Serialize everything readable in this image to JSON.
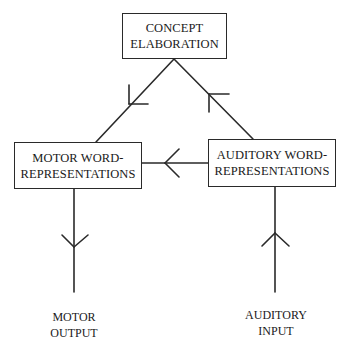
{
  "diagram": {
    "type": "flow",
    "nodes": {
      "concept": {
        "lines": [
          "CONCEPT",
          "ELABORATION"
        ]
      },
      "motor_word": {
        "lines": [
          "MOTOR WORD-",
          "REPRESENTATIONS"
        ]
      },
      "auditory_word": {
        "lines": [
          "AUDITORY WORD-",
          "REPRESENTATIONS"
        ]
      }
    },
    "terminals": {
      "motor_output": {
        "lines": [
          "MOTOR",
          "OUTPUT"
        ]
      },
      "auditory_input": {
        "lines": [
          "AUDITORY",
          "INPUT"
        ]
      }
    },
    "edges": [
      {
        "from": "auditory_input",
        "to": "auditory_word"
      },
      {
        "from": "auditory_word",
        "to": "concept"
      },
      {
        "from": "concept",
        "to": "motor_word"
      },
      {
        "from": "auditory_word",
        "to": "motor_word"
      },
      {
        "from": "motor_word",
        "to": "motor_output"
      }
    ],
    "colors": {
      "line": "#2a2a2a",
      "background": "#ffffff"
    }
  }
}
